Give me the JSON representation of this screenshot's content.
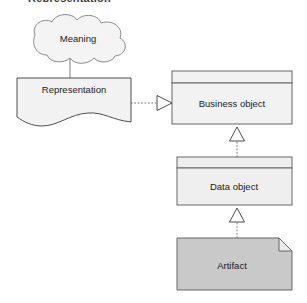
{
  "diagram": {
    "type": "uml-archimate-realization-diagram",
    "clipped_heading": "Representation",
    "nodes": [
      {
        "id": "meaning",
        "label": "Meaning",
        "shape": "cloud",
        "fill": "#f4f4f4",
        "stroke": "#808080"
      },
      {
        "id": "representation",
        "label": "Representation",
        "shape": "wavy-document",
        "fill": "#f2f2f2",
        "stroke": "#4d4d4d"
      },
      {
        "id": "business-object",
        "label": "Business object",
        "shape": "header-box",
        "fill": "#f2f2f2",
        "stroke": "#666666"
      },
      {
        "id": "data-object",
        "label": "Data object",
        "shape": "header-box",
        "fill": "#efefef",
        "stroke": "#666666"
      },
      {
        "id": "artifact",
        "label": "Artifact",
        "shape": "folded-corner-document",
        "fill": "#c9c9c9",
        "stroke": "#666666"
      }
    ],
    "connections": [
      {
        "id": "meaning-representation",
        "from": "meaning",
        "to": "representation",
        "style": "solid-line",
        "arrow": "none"
      },
      {
        "id": "representation-business-object",
        "from": "representation",
        "to": "business-object",
        "style": "dotted-line",
        "arrow": "hollow-triangle",
        "direction": "right"
      },
      {
        "id": "data-object-business-object",
        "from": "data-object",
        "to": "business-object",
        "style": "dotted-line",
        "arrow": "hollow-triangle",
        "direction": "up"
      },
      {
        "id": "artifact-data-object",
        "from": "artifact",
        "to": "data-object",
        "style": "dotted-line",
        "arrow": "hollow-triangle",
        "direction": "up"
      }
    ]
  }
}
